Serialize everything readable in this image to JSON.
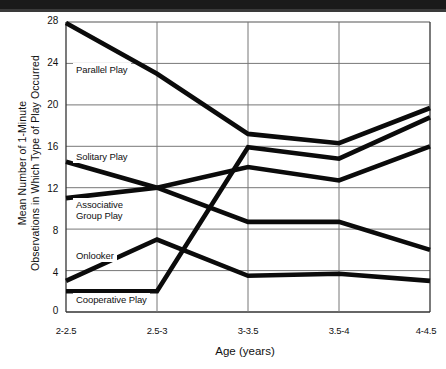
{
  "chart_data": {
    "type": "line",
    "title": "",
    "xlabel": "Age (years)",
    "ylabel": "Mean Number of 1-Minute Observations in Which Type of Play Occurred",
    "ylabel_line1": "Mean Number of 1-Minute",
    "ylabel_line2": "Observations in Which  Type of Play Occurred",
    "categories": [
      "2-2.5",
      "2.5-3",
      "3-3.5",
      "3.5-4",
      "4-4.5"
    ],
    "yticks": [
      0,
      4,
      8,
      12,
      16,
      20,
      24,
      28
    ],
    "ylim": [
      0,
      28
    ],
    "grid": true,
    "legend": "inline-labels",
    "series": [
      {
        "name": "Parallel Play",
        "values": [
          27.9,
          23.0,
          17.2,
          16.3,
          19.7
        ]
      },
      {
        "name": "Solitary Play",
        "values": [
          14.5,
          12.0,
          8.7,
          8.7,
          6.0
        ]
      },
      {
        "name": "Associative Group Play",
        "values": [
          11.0,
          12.0,
          14.0,
          12.7,
          16.0
        ]
      },
      {
        "name": "Onlooker",
        "values": [
          3.0,
          7.0,
          3.5,
          3.7,
          3.0
        ]
      },
      {
        "name": "Cooperative Play",
        "values": [
          2.0,
          2.0,
          15.9,
          14.8,
          18.8
        ]
      }
    ]
  },
  "annotations": {
    "parallel": "Parallel Play",
    "solitary": "Solitary Play",
    "associative_l1": "Associative",
    "associative_l2": "Group Play",
    "onlooker": "Onlooker",
    "cooperative": "Cooperative Play"
  }
}
